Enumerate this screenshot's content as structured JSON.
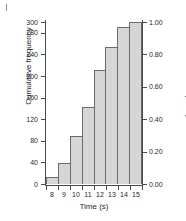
{
  "chart_data": {
    "type": "bar",
    "title": "",
    "subtitle": "",
    "xlabel": "Time (s)",
    "ylabel": "Cumulative frequency",
    "y2label": "Cumulative relative frequency",
    "categories": [
      "8",
      "9",
      "10",
      "11",
      "12",
      "13",
      "14",
      "15"
    ],
    "values": [
      13,
      38,
      88,
      142,
      212,
      253,
      290,
      300
    ],
    "relative_values": [
      0.04,
      0.13,
      0.29,
      0.47,
      0.71,
      0.84,
      0.97,
      1.0
    ],
    "ylim": [
      0,
      300
    ],
    "y2lim": [
      0.0,
      1.0
    ],
    "yticks": [
      0,
      40,
      80,
      120,
      160,
      200,
      240,
      280,
      300
    ],
    "ytick_labels": [
      "0",
      "40",
      "80",
      "120",
      "160",
      "200",
      "240",
      "280",
      "300"
    ],
    "y2ticks": [
      0.0,
      0.2,
      0.4,
      0.6,
      0.8,
      1.0
    ],
    "y2tick_labels": [
      "0.00",
      "0.20",
      "0.40",
      "0.60",
      "0.80",
      "1.00"
    ],
    "xtick_labels": [
      "8",
      "9",
      "10",
      "11",
      "12",
      "13",
      "14",
      "15"
    ],
    "grid": false,
    "legend": null,
    "legend_position": "none",
    "bar_fill_color": "#d6d6d6",
    "bar_edge_color": "#6b6b6b",
    "axis_color": "#4a4a4a",
    "text_color": "#1f1f1f",
    "background_color": "#ffffff"
  }
}
